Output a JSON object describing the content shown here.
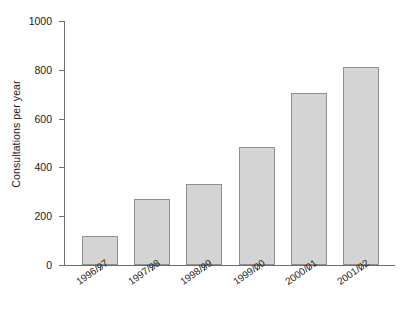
{
  "chart_data": {
    "type": "bar",
    "title": "",
    "subtitle": "",
    "xlabel": "",
    "ylabel": "Consultations per year",
    "categories": [
      "1996/97",
      "1997/98",
      "1998/99",
      "1999/00",
      "2000/01",
      "2001/02"
    ],
    "values": [
      120,
      270,
      330,
      485,
      705,
      810
    ],
    "ylim": [
      0,
      1000
    ],
    "yticks": [
      0,
      200,
      400,
      600,
      800,
      1000
    ],
    "ytick_labels": [
      "0",
      "200",
      "400",
      "600",
      "800",
      "1000"
    ],
    "grid": false,
    "legend": null,
    "series": [
      {
        "name": "Consultations per year",
        "values": [
          120,
          270,
          330,
          485,
          705,
          810
        ]
      }
    ],
    "colors": {
      "bar_fill": "#d4d4d4",
      "bar_edge": "#8f8f8f",
      "axis": "#6e6e6e",
      "text": "#1a1a1a",
      "background": "#ffffff"
    }
  }
}
